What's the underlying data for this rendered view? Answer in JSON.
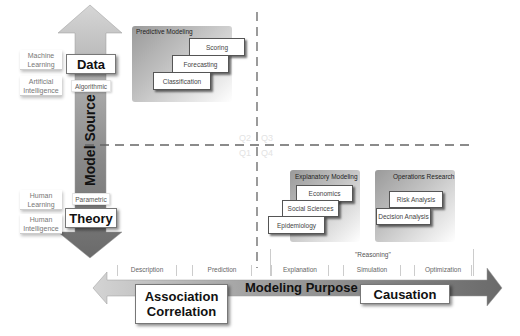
{
  "axes": {
    "vertical_title": "Model Source",
    "horizontal_title": "Modeling Purpose"
  },
  "vertical_axis": {
    "top_box": "Data",
    "bottom_box": "Theory",
    "top_tag": "Algorithmic",
    "bottom_tag": "Parametric",
    "left_labels_top": [
      {
        "text": "Machine\nLearning"
      },
      {
        "text": "Artificial\nIntelligence"
      }
    ],
    "left_labels_bottom": [
      {
        "text": "Human\nLearning"
      },
      {
        "text": "Human\nIntelligence"
      }
    ]
  },
  "horizontal_axis": {
    "left_box_line1": "Association",
    "left_box_line2": "Correlation",
    "right_box": "Causation",
    "reasoning_label": "\"Reasoning\"",
    "purposes": [
      "Description",
      "Prediction",
      "Explanation",
      "Simulation",
      "Optimization"
    ]
  },
  "quadrants": {
    "q1": "Q1",
    "q2": "Q2",
    "q3": "Q3",
    "q4": "Q4"
  },
  "panels": {
    "predictive": {
      "title": "Predictive Modeling",
      "cards": [
        "Scoring",
        "Forecasting",
        "Classification"
      ]
    },
    "explanatory": {
      "title": "Explanatory Modeling",
      "cards": [
        "Economics",
        "Social Sciences",
        "Epidemiology"
      ]
    },
    "operations": {
      "title": "Operations Research",
      "cards": [
        "Risk Analysis",
        "Decision Analysis"
      ]
    }
  },
  "colors": {
    "arrow_dark": "#6e6e6e",
    "arrow_light": "#c9c9c9",
    "dashed_line": "#666666",
    "quadrant_text": "#e3e3e3"
  }
}
